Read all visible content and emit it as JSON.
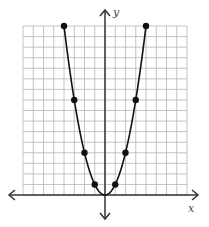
{
  "chart_data": {
    "type": "line",
    "title": "",
    "xlabel": "x",
    "ylabel": "y",
    "function": "y = x^2",
    "grid": true,
    "xlim": [
      -8,
      8
    ],
    "ylim": [
      0,
      16
    ],
    "points": [
      {
        "x": -4,
        "y": 16
      },
      {
        "x": -3,
        "y": 9
      },
      {
        "x": -2,
        "y": 4
      },
      {
        "x": -1,
        "y": 1
      },
      {
        "x": 1,
        "y": 1
      },
      {
        "x": 2,
        "y": 4
      },
      {
        "x": 3,
        "y": 9
      },
      {
        "x": 4,
        "y": 16
      }
    ],
    "colors": {
      "grid": "#b5b5b5",
      "axis": "#333333",
      "curve": "#111111",
      "point": "#111111"
    }
  },
  "labels": {
    "x_axis": "x",
    "y_axis": "y"
  }
}
